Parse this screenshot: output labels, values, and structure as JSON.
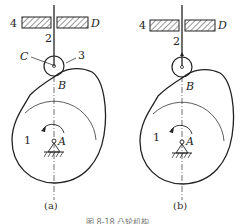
{
  "diagram": {
    "type": "cam-follower mechanism",
    "panels": [
      {
        "id": "a",
        "caption": "(a)",
        "labels": {
          "frame": "4",
          "guide": "D",
          "follower": "2",
          "roller_center": "C",
          "roller": "3",
          "contact_point": "B",
          "cam": "1",
          "pivot": "A"
        },
        "follower_type": "roller"
      },
      {
        "id": "b",
        "caption": "(b)",
        "labels": {
          "frame": "4",
          "guide": "D",
          "follower": "2",
          "contact_point": "B",
          "cam": "1",
          "pivot": "A"
        },
        "follower_type": "roller (pinned, no C/3 labels)"
      }
    ],
    "figure_caption": "图 8-18 凸轮机构",
    "colors": {
      "line": "#222222",
      "background": "#ffffff"
    }
  }
}
